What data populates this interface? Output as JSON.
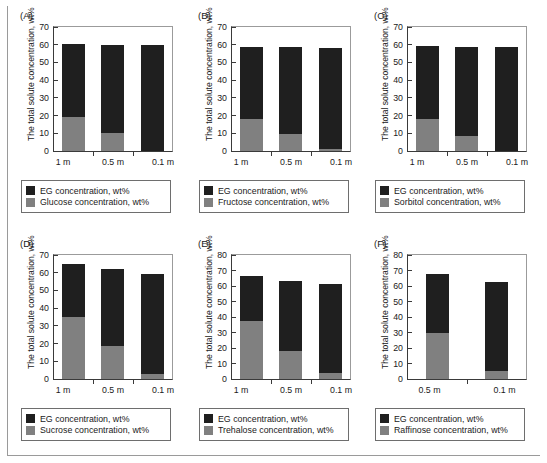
{
  "figure": {
    "axis_title": "The total solute concentration, wt%",
    "legend_eg": "EG concentration, wt%"
  },
  "chart_data": [
    {
      "type": "bar",
      "panel": "(A)",
      "title": "",
      "xlabel": "",
      "ylabel": "The total solute concentration, wt%",
      "ylim": [
        0,
        70
      ],
      "yticks": [
        0,
        10,
        20,
        30,
        40,
        50,
        60,
        70
      ],
      "grid": false,
      "stacked": true,
      "categories": [
        "1 m",
        "0.5 m",
        "0.1 m"
      ],
      "legend_position": "below",
      "series": [
        {
          "name": "Glucose concentration, wt%",
          "color": "#808080",
          "values": [
            19.3,
            10.3,
            0.0
          ]
        },
        {
          "name": "EG concentration, wt%",
          "color": "#1f1f1f",
          "values": [
            41.0,
            49.6,
            59.7
          ]
        }
      ],
      "totals": [
        60.3,
        59.9,
        59.7
      ]
    },
    {
      "type": "bar",
      "panel": "(B)",
      "title": "",
      "xlabel": "",
      "ylabel": "The total solute concentration, wt%",
      "ylim": [
        0,
        70
      ],
      "yticks": [
        0,
        10,
        20,
        30,
        40,
        50,
        60,
        70
      ],
      "grid": false,
      "stacked": true,
      "categories": [
        "1 m",
        "0.5 m",
        "0.1 m"
      ],
      "legend_position": "below",
      "series": [
        {
          "name": "Fructose concentration, wt%",
          "color": "#808080",
          "values": [
            18.2,
            9.6,
            0.9
          ]
        },
        {
          "name": "EG concentration, wt%",
          "color": "#1f1f1f",
          "values": [
            40.7,
            49.2,
            57.5
          ]
        }
      ],
      "totals": [
        58.9,
        58.8,
        58.4
      ]
    },
    {
      "type": "bar",
      "panel": "(C)",
      "title": "",
      "xlabel": "",
      "ylabel": "The total solute concentration, wt%",
      "ylim": [
        0,
        70
      ],
      "yticks": [
        0,
        10,
        20,
        30,
        40,
        50,
        60,
        70
      ],
      "grid": false,
      "stacked": true,
      "categories": [
        "1 m",
        "0.5 m",
        "0.1 m"
      ],
      "legend_position": "below",
      "series": [
        {
          "name": "Sorbitol concentration, wt%",
          "color": "#808080",
          "values": [
            18.2,
            8.5,
            0.0
          ]
        },
        {
          "name": "EG concentration, wt%",
          "color": "#1f1f1f",
          "values": [
            41.0,
            50.4,
            58.7
          ]
        }
      ],
      "totals": [
        59.2,
        58.9,
        58.7
      ]
    },
    {
      "type": "bar",
      "panel": "(D)",
      "title": "",
      "xlabel": "",
      "ylabel": "The total solute concentration, wt%",
      "ylim": [
        0,
        70
      ],
      "yticks": [
        0,
        10,
        20,
        30,
        40,
        50,
        60,
        70
      ],
      "grid": false,
      "stacked": true,
      "categories": [
        "1 m",
        "0.5 m",
        "0.1 m"
      ],
      "legend_position": "below",
      "series": [
        {
          "name": "Sucrose concentration, wt%",
          "color": "#808080",
          "values": [
            35.0,
            18.4,
            3.0
          ]
        },
        {
          "name": "EG concentration, wt%",
          "color": "#1f1f1f",
          "values": [
            30.1,
            43.8,
            56.2
          ]
        }
      ],
      "totals": [
        65.1,
        62.2,
        59.2
      ]
    },
    {
      "type": "bar",
      "panel": "(E)",
      "title": "",
      "xlabel": "",
      "ylabel": "The total solute concentration, wt%",
      "ylim": [
        0,
        80
      ],
      "yticks": [
        0,
        10,
        20,
        30,
        40,
        50,
        60,
        70,
        80
      ],
      "grid": false,
      "stacked": true,
      "categories": [
        "1 m",
        "0.5 m",
        "0.1 m"
      ],
      "legend_position": "below",
      "series": [
        {
          "name": "Trehalose concentration, wt%",
          "color": "#808080",
          "values": [
            37.4,
            18.2,
            3.8
          ]
        },
        {
          "name": "EG concentration, wt%",
          "color": "#1f1f1f",
          "values": [
            28.9,
            44.8,
            57.7
          ]
        }
      ],
      "totals": [
        66.3,
        63.0,
        61.5
      ]
    },
    {
      "type": "bar",
      "panel": "(F)",
      "title": "",
      "xlabel": "",
      "ylabel": "The total solute concentration, wt%",
      "ylim": [
        0,
        80
      ],
      "yticks": [
        0,
        10,
        20,
        30,
        40,
        50,
        60,
        70,
        80
      ],
      "grid": false,
      "stacked": true,
      "categories": [
        "0.5 m",
        "0.1 m"
      ],
      "legend_position": "below",
      "series": [
        {
          "name": "Raffinose concentration, wt%",
          "color": "#808080",
          "values": [
            29.6,
            5.4
          ]
        },
        {
          "name": "EG concentration, wt%",
          "color": "#1f1f1f",
          "values": [
            37.9,
            57.3
          ]
        }
      ],
      "totals": [
        67.5,
        62.7
      ]
    }
  ]
}
